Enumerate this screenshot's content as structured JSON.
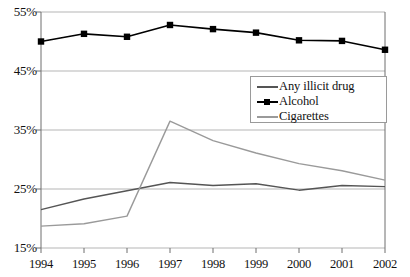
{
  "chart_data": {
    "type": "line",
    "title": "",
    "subtitle": "",
    "xlabel": "",
    "ylabel": "",
    "x": [
      1994,
      1995,
      1996,
      1997,
      1998,
      1999,
      2000,
      2001,
      2002
    ],
    "categories": [
      "1994",
      "1995",
      "1996",
      "1997",
      "1998",
      "1999",
      "2000",
      "2001",
      "2002"
    ],
    "ylim": [
      15,
      55
    ],
    "yticks": [
      15,
      25,
      35,
      45,
      55
    ],
    "ytick_labels": [
      "15%",
      "25%",
      "35%",
      "45%",
      "55%"
    ],
    "grid": true,
    "legend_position": "center-right",
    "series": [
      {
        "name": "Any illicit drug",
        "color": "#555555",
        "marker": "none",
        "values": [
          21.5,
          23.3,
          24.7,
          26.1,
          25.6,
          25.9,
          24.8,
          25.6,
          25.4
        ]
      },
      {
        "name": "Alcohol",
        "color": "#000000",
        "marker": "square",
        "values": [
          50.0,
          51.3,
          50.8,
          52.8,
          52.1,
          51.5,
          50.2,
          50.1,
          48.6
        ]
      },
      {
        "name": "Cigarettes",
        "color": "#9a9a9a",
        "marker": "none",
        "values": [
          18.7,
          19.1,
          20.4,
          36.5,
          33.2,
          31.1,
          29.3,
          28.1,
          26.5
        ]
      }
    ]
  },
  "legend": {
    "items": [
      {
        "label": "Any illicit drug"
      },
      {
        "label": "Alcohol"
      },
      {
        "label": "Cigarettes"
      }
    ]
  },
  "axes": {
    "y_labels": [
      "55%",
      "45%",
      "35%",
      "25%",
      "15%"
    ],
    "x_labels": [
      "1994",
      "1995",
      "1996",
      "1997",
      "1998",
      "1999",
      "2000",
      "2001",
      "2002"
    ]
  },
  "colors": {
    "illicit": "#555555",
    "alcohol": "#000000",
    "cigarettes": "#9a9a9a",
    "grid": "#b5b5b5",
    "axis": "#6f6f6f",
    "background": "#ffffff"
  }
}
